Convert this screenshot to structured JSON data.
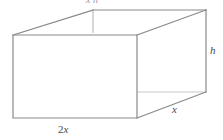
{
  "figure": {
    "name": "rectangular-prism-diagram",
    "type": "geometry-line-drawing",
    "canvas": {
      "width": 223,
      "height": 140
    },
    "stroke": {
      "visible_edge_color": "#8a8a8a",
      "hidden_edge_color": "#c4c4c4",
      "visible_edge_width": 1.2,
      "hidden_edge_width": 1
    },
    "background_color": "#ffffff",
    "shape_description": "open-top rectangular box drawn in oblique projection"
  },
  "labels": {
    "width": {
      "coefficient": "2",
      "variable": "x",
      "text": "2x"
    },
    "depth": {
      "variable": "x",
      "text": "x"
    },
    "height": {
      "variable": "h",
      "text": "h"
    },
    "clipped_top": {
      "text": "x h"
    }
  },
  "vertices": {
    "front_top_left": {
      "x": 13,
      "y": 35
    },
    "front_top_right": {
      "x": 137,
      "y": 35
    },
    "front_bottom_right": {
      "x": 137,
      "y": 118
    },
    "front_bottom_left": {
      "x": 13,
      "y": 118
    },
    "back_top_left": {
      "x": 93,
      "y": 10
    },
    "back_top_right": {
      "x": 206,
      "y": 10
    },
    "back_bottom_right": {
      "x": 206,
      "y": 92
    },
    "back_bottom_left": {
      "x": 93,
      "y": 33
    }
  }
}
